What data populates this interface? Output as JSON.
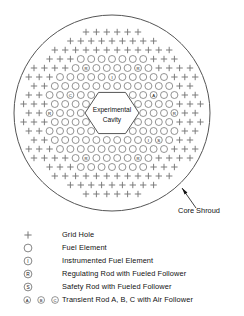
{
  "figure": {
    "cavity_label_line1": "Experimental",
    "cavity_label_line2": "Cavity",
    "shroud_label": "Core Shroud",
    "colors": {
      "line": "#555555",
      "cell": "#777777",
      "text": "#111111"
    }
  },
  "legend": {
    "rows": [
      {
        "symbols": [
          "+"
        ],
        "label": "Grid Hole"
      },
      {
        "symbols": [
          "O"
        ],
        "label": "Fuel Element"
      },
      {
        "symbols": [
          "I"
        ],
        "label": "Instrumented Fuel Element"
      },
      {
        "symbols": [
          "R"
        ],
        "label": "Regulating Rod with Fueled Follower"
      },
      {
        "symbols": [
          "S"
        ],
        "label": "Safety Rod with Fueled Follower"
      },
      {
        "symbols": [
          "A",
          "B",
          "C"
        ],
        "label": "Transient Rod A, B, C with Air Follower"
      }
    ]
  },
  "chart_data": {
    "type": "diagram",
    "geometry": {
      "shroud_center": [
        112,
        113
      ],
      "shroud_radius": 98,
      "lattice_pitch_x": 10.4,
      "lattice_pitch_y": 9.0,
      "cavity_center": [
        112,
        113
      ],
      "cavity_radius": 27,
      "cavity_orientation": "flat-top-bottom"
    },
    "symbol_counts": {
      "grid_hole": 196,
      "fuel_element": 168,
      "special_rods": 14
    },
    "special_positions": [
      {
        "id": "R1",
        "symbol": "R",
        "x": 86,
        "y": 65,
        "name": "Regulating Rod"
      },
      {
        "id": "R2",
        "symbol": "R",
        "x": 138,
        "y": 65,
        "name": "Regulating Rod"
      },
      {
        "id": "I1",
        "symbol": "I",
        "x": 112,
        "y": 74,
        "name": "Instrumented Fuel Element"
      },
      {
        "id": "C1",
        "symbol": "C",
        "x": 70,
        "y": 92,
        "name": "Transient Rod C"
      },
      {
        "id": "A1",
        "symbol": "A",
        "x": 154,
        "y": 92,
        "name": "Transient Rod A"
      },
      {
        "id": "R3",
        "symbol": "R",
        "x": 49,
        "y": 115,
        "name": "Regulating Rod"
      },
      {
        "id": "R4",
        "symbol": "R",
        "x": 175,
        "y": 115,
        "name": "Regulating Rod"
      },
      {
        "id": "S1",
        "symbol": "S",
        "x": 70,
        "y": 142,
        "name": "Safety Rod"
      },
      {
        "id": "I2",
        "symbol": "I",
        "x": 148,
        "y": 142,
        "name": "Instrumented Fuel Element"
      },
      {
        "id": "S2",
        "symbol": "S",
        "x": 159,
        "y": 142,
        "name": "Safety Rod"
      },
      {
        "id": "I3",
        "symbol": "I",
        "x": 86,
        "y": 151,
        "name": "Instrumented Fuel Element"
      },
      {
        "id": "R5",
        "symbol": "R",
        "x": 86,
        "y": 160,
        "name": "Regulating Rod"
      },
      {
        "id": "B1",
        "symbol": "B",
        "x": 112,
        "y": 160,
        "name": "Transient Rod B"
      },
      {
        "id": "R6",
        "symbol": "R",
        "x": 138,
        "y": 160,
        "name": "Regulating Rod"
      }
    ]
  }
}
